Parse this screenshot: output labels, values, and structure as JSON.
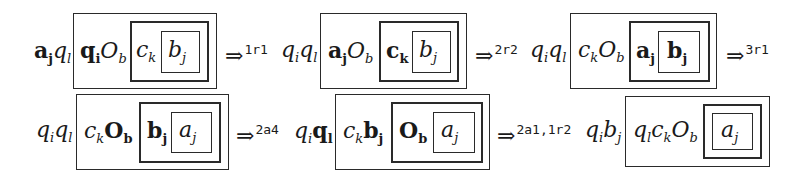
{
  "diagram": {
    "rows": [
      {
        "configs": [
          {
            "prefix": [
              {
                "base": "a",
                "sub": "j",
                "bold": true
              },
              {
                "base": "q",
                "sub": "l",
                "bold": false
              }
            ],
            "outer": [
              {
                "base": "q",
                "sub": "i",
                "bold": true
              },
              {
                "base": "O",
                "sub": "b",
                "bold": false
              }
            ],
            "middle": [
              {
                "base": "c",
                "sub": "k",
                "bold": false
              }
            ],
            "inner": [
              {
                "base": "b",
                "sub": "j",
                "bold": false
              }
            ],
            "arrow_label": "1r1"
          },
          {
            "prefix": [
              {
                "base": "q",
                "sub": "i",
                "bold": false
              },
              {
                "base": "q",
                "sub": "l",
                "bold": false
              }
            ],
            "outer": [
              {
                "base": "a",
                "sub": "j",
                "bold": true
              },
              {
                "base": "O",
                "sub": "b",
                "bold": false
              }
            ],
            "middle": [
              {
                "base": "c",
                "sub": "k",
                "bold": true
              }
            ],
            "inner": [
              {
                "base": "b",
                "sub": "j",
                "bold": false
              }
            ],
            "arrow_label": "2r2"
          },
          {
            "prefix": [
              {
                "base": "q",
                "sub": "i",
                "bold": false
              },
              {
                "base": "q",
                "sub": "l",
                "bold": false
              }
            ],
            "outer": [
              {
                "base": "c",
                "sub": "k",
                "bold": false
              },
              {
                "base": "O",
                "sub": "b",
                "bold": false
              }
            ],
            "middle": [
              {
                "base": "a",
                "sub": "j",
                "bold": true
              }
            ],
            "inner": [
              {
                "base": "b",
                "sub": "j",
                "bold": true
              }
            ],
            "arrow_label": "3r1"
          }
        ]
      },
      {
        "configs": [
          {
            "prefix": [
              {
                "base": "q",
                "sub": "i",
                "bold": false
              },
              {
                "base": "q",
                "sub": "l",
                "bold": false
              }
            ],
            "outer": [
              {
                "base": "c",
                "sub": "k",
                "bold": false
              },
              {
                "base": "O",
                "sub": "b",
                "bold": true
              }
            ],
            "middle": [
              {
                "base": "b",
                "sub": "j",
                "bold": true
              }
            ],
            "inner": [
              {
                "base": "a",
                "sub": "j",
                "bold": false
              }
            ],
            "arrow_label": "2a4"
          },
          {
            "prefix": [
              {
                "base": "q",
                "sub": "i",
                "bold": false
              },
              {
                "base": "q",
                "sub": "l",
                "bold": true
              }
            ],
            "outer": [
              {
                "base": "c",
                "sub": "k",
                "bold": false
              },
              {
                "base": "b",
                "sub": "j",
                "bold": true
              }
            ],
            "middle": [
              {
                "base": "O",
                "sub": "b",
                "bold": true
              }
            ],
            "inner": [
              {
                "base": "a",
                "sub": "j",
                "bold": false
              }
            ],
            "arrow_label": "2a1,1r2"
          },
          {
            "prefix": [
              {
                "base": "q",
                "sub": "i",
                "bold": false
              },
              {
                "base": "b",
                "sub": "j",
                "bold": false
              }
            ],
            "outer": [
              {
                "base": "q",
                "sub": "l",
                "bold": false
              },
              {
                "base": "c",
                "sub": "k",
                "bold": false
              },
              {
                "base": "O",
                "sub": "b",
                "bold": false
              }
            ],
            "middle": [],
            "inner": [
              {
                "base": "a",
                "sub": "j",
                "bold": false
              }
            ]
          }
        ]
      }
    ],
    "arrow_symbol": "⇒"
  }
}
